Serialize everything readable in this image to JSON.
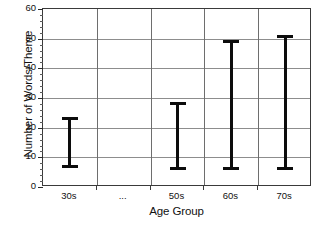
{
  "chart_data": {
    "type": "bar",
    "subtype": "error-bar-range",
    "title": "",
    "xlabel": "Age Group",
    "ylabel": "Number of Words/Theme",
    "categories": [
      "30s",
      "...",
      "50s",
      "60s",
      "70s"
    ],
    "ylim": [
      0,
      60
    ],
    "ytick_labels": [
      "0",
      "10",
      "20",
      "30",
      "40",
      "50",
      "60"
    ],
    "ytick_values": [
      0,
      10,
      20,
      30,
      40,
      50,
      60
    ],
    "ytick_minor_step": 2,
    "grid": {
      "horizontal": true,
      "vertical": true
    },
    "legend": null,
    "series": [
      {
        "name": "Range",
        "low": [
          6.5,
          null,
          5.7,
          5.8,
          5.6
        ],
        "high": [
          23.7,
          null,
          28.7,
          49.5,
          51.3
        ]
      }
    ],
    "points": [
      {
        "category": "30s",
        "low": 6.5,
        "high": 23.7
      },
      {
        "category": "...",
        "low": null,
        "high": null
      },
      {
        "category": "50s",
        "low": 5.7,
        "high": 28.7
      },
      {
        "category": "60s",
        "low": 5.8,
        "high": 49.5
      },
      {
        "category": "70s",
        "low": 5.6,
        "high": 51.3
      }
    ],
    "colors": {
      "bar": "#0c0c0c",
      "grid": "#8d8d8d",
      "frame": "#3a3a3a",
      "text": "#111111",
      "background": "#ffffff"
    }
  }
}
